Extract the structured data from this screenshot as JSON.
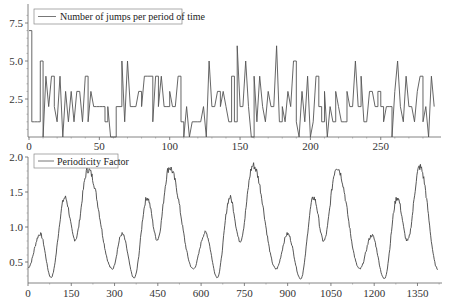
{
  "chart_data": [
    {
      "type": "line",
      "title": "",
      "xlabel": "",
      "ylabel": "",
      "legend": [
        "Number of jumps per period of time"
      ],
      "legend_position": "upper left",
      "grid": false,
      "xlim": [
        0,
        290
      ],
      "ylim": [
        0,
        8.4
      ],
      "xticks": [
        0,
        50,
        100,
        150,
        200,
        250
      ],
      "yticks": [
        2.5,
        5.0,
        7.5
      ],
      "xtick_labels": [
        "0",
        "50",
        "100",
        "150",
        "200",
        "250"
      ],
      "ytick_labels": [
        "2.5",
        "5.0",
        "7.5"
      ],
      "x_step": 2,
      "series": [
        {
          "name": "Number of jumps per period of time",
          "color": "#555555",
          "values": [
            7,
            1,
            1,
            1,
            5,
            0,
            4,
            2,
            4,
            2,
            1,
            4,
            0,
            3,
            1,
            3,
            1,
            3,
            3,
            1,
            4,
            1,
            3,
            2,
            2,
            2,
            2,
            1,
            2,
            0,
            0,
            2,
            2,
            5,
            1,
            5,
            2,
            2,
            2,
            3,
            2,
            4,
            4,
            4,
            1,
            4,
            2,
            4,
            2,
            2,
            3,
            2,
            2,
            4,
            1,
            0,
            2,
            0,
            1,
            1,
            1,
            1,
            2,
            0,
            5,
            2,
            2,
            3,
            2,
            3,
            2,
            1,
            4,
            1,
            6,
            2,
            2,
            5,
            2,
            0,
            4,
            1,
            4,
            2,
            1,
            3,
            2,
            2,
            6,
            1,
            2,
            1,
            3,
            2,
            5,
            1,
            0,
            3,
            1,
            4,
            0,
            1,
            4,
            2,
            1,
            3,
            0,
            2,
            1,
            3,
            2,
            1,
            1,
            3,
            2,
            2,
            5,
            2,
            4,
            1,
            1,
            3,
            3,
            2,
            3,
            2,
            1,
            2,
            2,
            0,
            3,
            5,
            2,
            1,
            4,
            2,
            2,
            1,
            3,
            4,
            1,
            2,
            0,
            4,
            2
          ]
        }
      ]
    },
    {
      "type": "line",
      "title": "",
      "xlabel": "",
      "ylabel": "",
      "legend": [
        "Periodicity Factor"
      ],
      "legend_position": "upper left",
      "grid": false,
      "xlim": [
        0,
        1440
      ],
      "ylim": [
        0.22,
        2.0
      ],
      "xticks": [
        0,
        150,
        300,
        450,
        600,
        750,
        900,
        1050,
        1200,
        1350
      ],
      "yticks": [
        0.5,
        1.0,
        1.5,
        2.0
      ],
      "xtick_labels": [
        "0",
        "150",
        "300",
        "450",
        "600",
        "750",
        "900",
        "1050",
        "1200",
        "1350"
      ],
      "ytick_labels": [
        "0.5",
        "1.0",
        "1.5",
        "2.0"
      ],
      "series": [
        {
          "name": "Periodicity Factor",
          "color": "#555555",
          "keypoints_x": [
            0,
            42,
            80,
            128,
            163,
            208,
            292,
            326,
            368,
            413,
            448,
            490,
            573,
            615,
            656,
            700,
            735,
            780,
            860,
            900,
            945,
            990,
            1025,
            1070,
            1150,
            1192,
            1235,
            1280,
            1315,
            1358,
            1420
          ],
          "keypoints_y": [
            0.42,
            0.9,
            0.28,
            1.42,
            0.82,
            1.82,
            0.4,
            0.9,
            0.27,
            1.42,
            0.82,
            1.85,
            0.4,
            0.92,
            0.28,
            1.42,
            0.8,
            1.88,
            0.4,
            0.9,
            0.26,
            1.42,
            0.8,
            1.86,
            0.4,
            0.88,
            0.26,
            1.42,
            0.8,
            1.86,
            0.4
          ]
        }
      ]
    }
  ],
  "charts": {
    "top": {
      "legend_label": "Number of jumps per period of time"
    },
    "bottom": {
      "legend_label": "Periodicity Factor"
    }
  }
}
